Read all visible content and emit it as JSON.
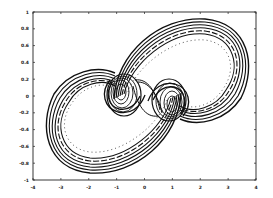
{
  "chart_data": {
    "type": "line",
    "title": "",
    "subtitle": "",
    "xlabel": "",
    "ylabel": "",
    "xlim": [
      -4,
      4
    ],
    "ylim": [
      -1,
      1
    ],
    "grid": false,
    "legend": null,
    "x_ticks": [
      "-4",
      "-3",
      "-2",
      "-1",
      "0",
      "1",
      "2",
      "3",
      "4"
    ],
    "y_ticks": [
      "-1",
      "-0.8",
      "-0.6",
      "-0.4",
      "-0.2",
      "0",
      "0.2",
      "0.4",
      "0.6",
      "0.8",
      "1"
    ],
    "series": [
      {
        "name": "outer-band-upper",
        "style": "solid-thick",
        "x": [
          -0.5,
          0.0,
          1.0,
          2.0,
          2.8,
          3.0,
          2.6,
          1.8,
          1.0
        ],
        "y": [
          0.2,
          0.55,
          0.85,
          0.9,
          0.65,
          0.3,
          0.0,
          -0.15,
          -0.1
        ]
      },
      {
        "name": "outer-band-lower",
        "style": "solid-thick",
        "x": [
          0.5,
          0.0,
          -1.0,
          -2.0,
          -2.8,
          -3.0,
          -2.6,
          -1.8,
          -1.0
        ],
        "y": [
          -0.2,
          -0.55,
          -0.85,
          -0.9,
          -0.65,
          -0.3,
          0.0,
          0.15,
          0.1
        ]
      },
      {
        "name": "dotted-inner-upper",
        "style": "dotted",
        "x": [
          0.0,
          1.0,
          2.0,
          2.6,
          2.5,
          1.9
        ],
        "y": [
          0.5,
          0.75,
          0.78,
          0.5,
          0.15,
          -0.05
        ]
      },
      {
        "name": "dotted-inner-lower",
        "style": "dotted",
        "x": [
          0.0,
          -1.0,
          -2.0,
          -2.6,
          -2.5,
          -1.9
        ],
        "y": [
          -0.5,
          -0.75,
          -0.78,
          -0.5,
          -0.15,
          0.05
        ]
      },
      {
        "name": "left-spiral",
        "style": "solid",
        "center": [
          -1.0,
          0.05
        ],
        "radii_x": [
          0.15,
          0.25,
          0.35,
          0.45,
          0.55
        ],
        "radii_y": [
          0.08,
          0.12,
          0.17,
          0.22,
          0.27
        ]
      },
      {
        "name": "right-spiral",
        "style": "solid",
        "center": [
          0.9,
          -0.05
        ],
        "radii_x": [
          0.15,
          0.25,
          0.35,
          0.45,
          0.55
        ],
        "radii_y": [
          0.08,
          0.12,
          0.17,
          0.22,
          0.27
        ]
      }
    ]
  },
  "axes": {
    "x_labels": [
      "-4",
      "-3",
      "-2",
      "-1",
      "0",
      "1",
      "2",
      "3",
      "4"
    ],
    "y_labels": [
      "1",
      "0.8",
      "0.6",
      "0.4",
      "0.2",
      "0",
      "-0.2",
      "-0.4",
      "-0.6",
      "-0.8",
      "-1"
    ]
  }
}
